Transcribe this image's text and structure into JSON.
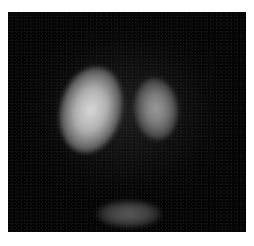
{
  "image": {
    "subject": "grayscale scintigraphy-style scan with two bright uptake regions and a faint lower region",
    "background_color": "#050505",
    "frame_color": "#ffffff",
    "regions": [
      {
        "name": "left-uptake",
        "intensity": "high"
      },
      {
        "name": "right-uptake",
        "intensity": "medium"
      },
      {
        "name": "bottom-uptake",
        "intensity": "low"
      }
    ]
  },
  "caption": {
    "text": ""
  }
}
